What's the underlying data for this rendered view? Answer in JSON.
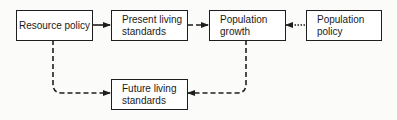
{
  "diagram": {
    "type": "flowchart",
    "nodes": [
      {
        "id": "resource_policy",
        "label": "Resource policy"
      },
      {
        "id": "present_living_standards",
        "label": "Present living\nstandards"
      },
      {
        "id": "population_growth",
        "label": "Population\ngrowth"
      },
      {
        "id": "population_policy",
        "label": "Population\npolicy"
      },
      {
        "id": "future_living_standards",
        "label": "Future living\nstandards"
      }
    ],
    "edges": [
      {
        "from": "resource_policy",
        "to": "present_living_standards",
        "style": "solid"
      },
      {
        "from": "present_living_standards",
        "to": "population_growth",
        "style": "dashed"
      },
      {
        "from": "population_policy",
        "to": "population_growth",
        "style": "dotted"
      },
      {
        "from": "resource_policy",
        "to": "future_living_standards",
        "style": "dashed"
      },
      {
        "from": "population_growth",
        "to": "future_living_standards",
        "style": "dashed"
      }
    ],
    "colors": {
      "stroke": "#1e1e1e",
      "background": "#fbfbfa"
    }
  }
}
